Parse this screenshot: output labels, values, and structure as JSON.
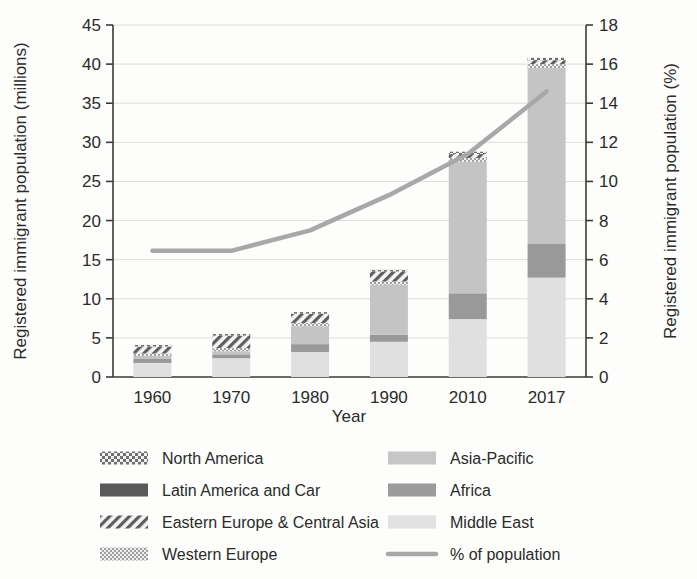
{
  "chart_data": {
    "type": "bar",
    "title": "",
    "subtitle": "",
    "xlabel": "Year",
    "ylabel": "Registered immigrant population (millions)",
    "y2label": "Registered immigrant population (%)",
    "categories": [
      "1960",
      "1970",
      "1980",
      "1990",
      "2010",
      "2017"
    ],
    "ylim": [
      0,
      45
    ],
    "y2lim": [
      0,
      18
    ],
    "yticks": [
      "0",
      "5",
      "10",
      "15",
      "20",
      "25",
      "30",
      "35",
      "40",
      "45"
    ],
    "y2ticks": [
      "0",
      "2",
      "4",
      "6",
      "8",
      "10",
      "12",
      "14",
      "16",
      "18"
    ],
    "grid": true,
    "legend_position": "bottom",
    "stack_order_bottom_to_top": [
      "Middle East",
      "Africa",
      "Asia-Pacific",
      "Western Europe",
      "Eastern Europe & Central Asia",
      "North America"
    ],
    "series": [
      {
        "name": "Middle East",
        "pattern": "solid-lightest",
        "color": "#e0e0e0",
        "values": [
          1.8,
          2.4,
          3.2,
          4.5,
          7.4,
          12.7
        ]
      },
      {
        "name": "Africa",
        "pattern": "solid-medium",
        "color": "#999999",
        "values": [
          0.5,
          0.5,
          1.0,
          0.9,
          3.3,
          4.3
        ]
      },
      {
        "name": "Asia-Pacific",
        "pattern": "solid-light",
        "color": "#c4c4c4",
        "values": [
          0.4,
          0.4,
          2.3,
          6.4,
          16.8,
          22.5
        ]
      },
      {
        "name": "Western Europe",
        "pattern": "fine-checker",
        "color": "#b8b8b8",
        "values": [
          0.3,
          0.4,
          0.4,
          0.4,
          0.5,
          0.5
        ]
      },
      {
        "name": "Eastern Europe & Central Asia",
        "pattern": "diagonal-hatch",
        "color": "#8f8f8f",
        "values": [
          0.9,
          1.6,
          1.2,
          1.3,
          0.5,
          0.5
        ]
      },
      {
        "name": "North America",
        "pattern": "coarse-checker",
        "color": "#7a7a7a",
        "values": [
          0.2,
          0.2,
          0.2,
          0.2,
          0.3,
          0.3
        ]
      }
    ],
    "bar_totals": [
      4.1,
      5.5,
      8.3,
      13.7,
      28.8,
      40.8
    ],
    "line_series": {
      "name": "% of population",
      "color": "#a8a8a8",
      "axis": "right",
      "values_percent": [
        6.45,
        6.45,
        7.5,
        9.3,
        11.4,
        14.6
      ]
    }
  },
  "legend": {
    "items": [
      {
        "label": "North America",
        "swatch": "coarse-checker-swatch"
      },
      {
        "label": "Asia-Pacific",
        "swatch": "solid-light-swatch"
      },
      {
        "label": "Latin America and Car",
        "swatch": "solid-dark-swatch"
      },
      {
        "label": "Africa",
        "swatch": "solid-medium-swatch"
      },
      {
        "label": "Eastern Europe & Central Asia",
        "swatch": "diagonal-hatch-swatch"
      },
      {
        "label": "Middle East",
        "swatch": "solid-lightest-swatch"
      },
      {
        "label": "Western Europe",
        "swatch": "fine-checker-swatch"
      },
      {
        "label": "% of population",
        "swatch": "line-swatch"
      }
    ]
  },
  "colors": {
    "axis": "#3a3a3a",
    "grid": "#dcdcdc",
    "line": "#a8a8a8",
    "text": "#2b2b2b",
    "background": "#fdfdfb"
  }
}
